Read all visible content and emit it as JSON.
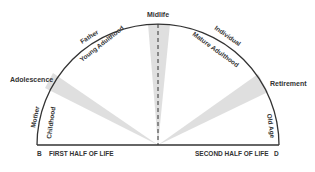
{
  "diagram": {
    "top_label": "Midlife",
    "left_side_label": "Adolescence",
    "right_side_label": "Retirement",
    "outer_arc_labels": {
      "left_bottom": "Mother",
      "left_top": "Father",
      "right_top": "Individual"
    },
    "inner_arc_labels": {
      "childhood": "Childhood",
      "young_adulthood": "Young Adulthood",
      "mature_adulthood": "Mature Adulthood",
      "old_age": "Old Age"
    },
    "baseline": {
      "left_point": "B",
      "left_text": "FIRST HALF OF LIFE",
      "right_text": "SECOND HALF OF LIFE",
      "right_point": "D"
    },
    "colors": {
      "arc": "#333333",
      "wedge": "#d9d9d9",
      "text": "#333333"
    }
  }
}
